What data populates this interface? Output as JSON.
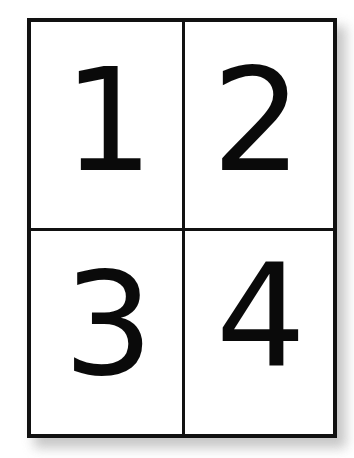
{
  "diagram": {
    "layout": "2x2",
    "cells": [
      {
        "position": "top-left",
        "label": "1"
      },
      {
        "position": "top-right",
        "label": "2"
      },
      {
        "position": "bottom-left",
        "label": "3"
      },
      {
        "position": "bottom-right",
        "label": "4"
      }
    ],
    "colors": {
      "border": "#111111",
      "text": "#0a0a0a",
      "background": "#ffffff",
      "shadow": "#bdbdbd"
    }
  }
}
